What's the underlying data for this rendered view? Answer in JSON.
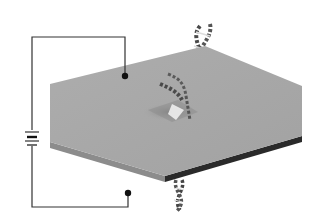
{
  "diagram": {
    "type": "nanopore-dna-translocation-schematic",
    "components": {
      "circuit": {
        "battery_icon": "battery-icon",
        "electrodes": [
          "top-electrode",
          "bottom-electrode"
        ]
      },
      "membrane": {
        "label": "",
        "pore": "nanopore"
      },
      "molecule": {
        "name": "dna-double-helix"
      }
    },
    "colors": {
      "background": "#ffffff",
      "membrane_top": "#a9a9a9",
      "membrane_side_left": "#8c8c8c",
      "membrane_side_right": "#2a2a2a",
      "wire": "#333333",
      "electrode": "#111111",
      "dna": "#4a4a4a",
      "dna_highlight": "#e8e8e8"
    }
  }
}
